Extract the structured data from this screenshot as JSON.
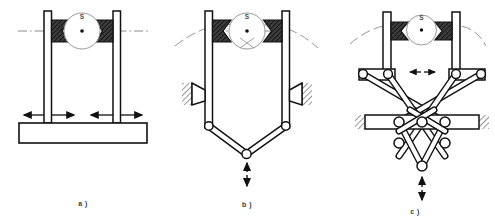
{
  "figure": {
    "background_color": "#ffffff",
    "line_color": "#1a1a1a",
    "hatch_color": "#8a8a8a",
    "wedge_fill": "#4a4a4a",
    "thin_line_color": "#6b6b6b",
    "width": 495,
    "height": 221
  },
  "panels": [
    {
      "id": "a",
      "caption": "a )",
      "cam_label": "S",
      "description": "parallel two-jaw slide gripper with cam drive and straight base bar",
      "motion_arrows": "four horizontal arrows on the jaw slides",
      "motion_direction": "horizontal"
    },
    {
      "id": "b",
      "caption": "b )",
      "cam_label": "S",
      "description": "V-linkage gripper with cam drive, wedge bearings on hatched ground supports",
      "motion_arrows": "one vertical double arrow below the V joint",
      "motion_direction": "vertical"
    },
    {
      "id": "c",
      "caption": "c )",
      "cam_label": "S",
      "description": "crossed scissor pantograph gripper with cam drive and hatched ground bar",
      "motion_arrows": "small horizontal double arrow at the linkage top and a vertical double arrow below",
      "motion_direction": "vertical and horizontal"
    }
  ],
  "captions": {
    "a": "a )",
    "b": "b )",
    "c": "c )"
  },
  "cam": {
    "label": "S",
    "note": "driving cam disc shown with centre dot"
  }
}
